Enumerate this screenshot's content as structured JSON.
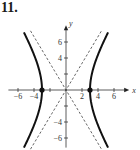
{
  "problem": {
    "number": "11."
  },
  "chart_data": {
    "type": "line",
    "title": "",
    "xlabel": "x",
    "ylabel": "y",
    "xlim": [
      -7,
      7
    ],
    "ylim": [
      -7,
      7
    ],
    "grid": false,
    "x_ticks": [
      -6,
      -4,
      -2,
      2,
      4,
      6
    ],
    "x_tick_labels": [
      "−6",
      "−4",
      "2",
      "4",
      "6"
    ],
    "y_ticks": [
      -6,
      -4,
      -2,
      2,
      4,
      6
    ],
    "y_tick_labels": [
      "6",
      "4",
      "−4",
      "−6"
    ],
    "series": [
      {
        "name": "hyperbola",
        "equation": "x^2/9 - y^2/25 = 1",
        "style": "solid-thick",
        "vertices": [
          [
            -3,
            0
          ],
          [
            3,
            0
          ]
        ]
      },
      {
        "name": "asymptote-positive",
        "equation": "y = (5/3)x",
        "style": "dashed"
      },
      {
        "name": "asymptote-negative",
        "equation": "y = -(5/3)x",
        "style": "dashed"
      }
    ],
    "points": [
      {
        "x": -3,
        "y": 0
      },
      {
        "x": 3,
        "y": 0
      }
    ]
  }
}
